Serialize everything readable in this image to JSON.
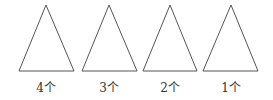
{
  "diagram": {
    "stroke_color": "#555555",
    "triangles": [
      {
        "label": "4个",
        "apex": [
          46,
          5
        ],
        "base_left": [
          19,
          71
        ],
        "base_right": [
          74,
          71
        ]
      },
      {
        "label": "3个",
        "apex": [
          109,
          5
        ],
        "base_left": [
          82,
          71
        ],
        "base_right": [
          137,
          71
        ]
      },
      {
        "label": "2个",
        "apex": [
          170,
          5
        ],
        "base_left": [
          143,
          71
        ],
        "base_right": [
          197,
          71
        ]
      },
      {
        "label": "1个",
        "apex": [
          231,
          5
        ],
        "base_left": [
          203,
          71
        ],
        "base_right": [
          258,
          71
        ]
      }
    ]
  }
}
